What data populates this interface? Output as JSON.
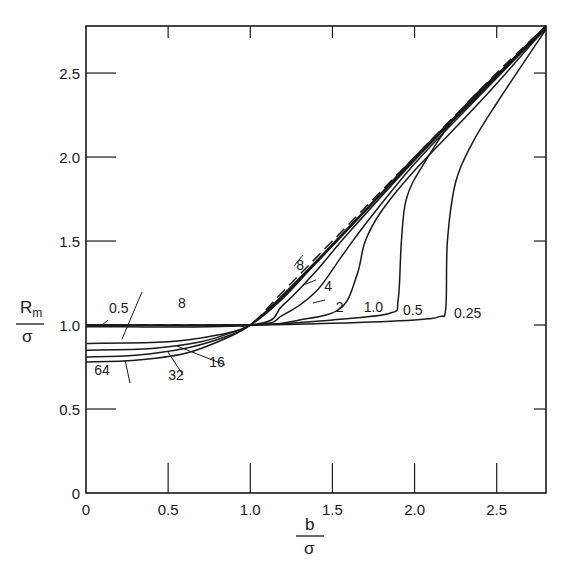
{
  "chart_data": {
    "type": "line",
    "title": "",
    "xlabel": "b / σ",
    "ylabel": "R_m / σ",
    "xlim": [
      0,
      2.8
    ],
    "ylim": [
      0,
      2.78
    ],
    "grid": false,
    "x_ticks": [
      "0",
      "0.5",
      "1.0",
      "1.5",
      "2.0",
      "2.5"
    ],
    "y_ticks": [
      "0",
      "0.5",
      "1.0",
      "1.5",
      "2.0",
      "2.5"
    ],
    "x_tick_values": [
      0,
      0.5,
      1.0,
      1.5,
      2.0,
      2.5
    ],
    "y_tick_values": [
      0,
      0.5,
      1.0,
      1.5,
      2.0,
      2.5
    ],
    "series": [
      {
        "name": "asymptote (dashed)",
        "style": "dashed",
        "x": [
          0,
          0.5,
          0.9,
          1.0,
          1.2,
          1.5,
          2.0,
          2.5,
          2.8
        ],
        "y": [
          1.0,
          1.0,
          1.0,
          1.0,
          1.2,
          1.5,
          2.0,
          2.5,
          2.78
        ]
      },
      {
        "name": "0.25",
        "x": [
          0,
          1.0,
          1.5,
          2.0,
          2.15,
          2.19,
          2.2,
          2.25,
          2.35,
          2.5,
          2.8
        ],
        "y": [
          1.0,
          1.0,
          1.01,
          1.03,
          1.05,
          1.1,
          1.5,
          1.85,
          2.08,
          2.32,
          2.76
        ]
      },
      {
        "name": "0.5",
        "x": [
          0,
          1.0,
          1.5,
          1.85,
          1.9,
          1.92,
          1.95,
          2.05,
          2.3,
          2.8
        ],
        "y": [
          1.0,
          1.0,
          1.03,
          1.07,
          1.15,
          1.5,
          1.75,
          1.95,
          2.3,
          2.76
        ]
      },
      {
        "name": "1.0",
        "x": [
          0,
          1.0,
          1.3,
          1.55,
          1.65,
          1.7,
          1.8,
          2.0,
          2.4,
          2.8
        ],
        "y": [
          1.0,
          1.0,
          1.03,
          1.1,
          1.3,
          1.5,
          1.68,
          1.92,
          2.33,
          2.77
        ]
      },
      {
        "name": "2",
        "x": [
          0,
          1.0,
          1.2,
          1.4,
          1.55,
          1.7,
          2.0,
          2.4,
          2.8
        ],
        "y": [
          1.0,
          1.0,
          1.06,
          1.2,
          1.4,
          1.6,
          1.96,
          2.37,
          2.77
        ]
      },
      {
        "name": "4",
        "x": [
          0,
          1.0,
          1.2,
          1.4,
          1.6,
          2.0,
          2.4,
          2.8
        ],
        "y": [
          0.99,
          1.0,
          1.12,
          1.32,
          1.55,
          1.98,
          2.38,
          2.77
        ]
      },
      {
        "name": "8",
        "x": [
          0,
          0.5,
          0.8,
          1.0,
          1.2,
          1.4,
          1.7,
          2.0,
          2.4,
          2.8
        ],
        "y": [
          0.89,
          0.9,
          0.94,
          1.0,
          1.16,
          1.37,
          1.68,
          2.0,
          2.39,
          2.78
        ]
      },
      {
        "name": "16",
        "x": [
          0,
          0.4,
          0.7,
          0.9,
          1.0,
          1.2,
          1.5,
          2.0,
          2.4,
          2.8
        ],
        "y": [
          0.85,
          0.86,
          0.9,
          0.96,
          1.0,
          1.17,
          1.47,
          1.99,
          2.39,
          2.78
        ]
      },
      {
        "name": "32",
        "x": [
          0,
          0.3,
          0.6,
          0.85,
          1.0,
          1.2,
          1.5,
          2.0,
          2.4,
          2.8
        ],
        "y": [
          0.81,
          0.82,
          0.86,
          0.93,
          1.0,
          1.18,
          1.48,
          1.99,
          2.39,
          2.78
        ]
      },
      {
        "name": "64",
        "x": [
          0,
          0.3,
          0.6,
          0.85,
          1.0,
          1.2,
          1.5,
          2.0,
          2.4,
          2.8
        ],
        "y": [
          0.78,
          0.79,
          0.83,
          0.92,
          1.0,
          1.18,
          1.48,
          1.99,
          2.39,
          2.78
        ]
      }
    ],
    "annotations": [
      {
        "text": "0.5",
        "x": 0.14,
        "y": 1.07
      },
      {
        "text": "8",
        "x": 0.56,
        "y": 1.1
      },
      {
        "text": "64",
        "x": 0.05,
        "y": 0.7
      },
      {
        "text": "32",
        "x": 0.5,
        "y": 0.67
      },
      {
        "text": "16",
        "x": 0.75,
        "y": 0.75
      },
      {
        "text": "8",
        "x": 1.28,
        "y": 1.33
      },
      {
        "text": "4",
        "x": 1.45,
        "y": 1.2
      },
      {
        "text": "2",
        "x": 1.52,
        "y": 1.08
      },
      {
        "text": "1.0",
        "x": 1.69,
        "y": 1.08
      },
      {
        "text": "0.5",
        "x": 1.93,
        "y": 1.06
      },
      {
        "text": "0.25",
        "x": 2.24,
        "y": 1.04
      }
    ],
    "legend": "none (curves labeled inline)"
  },
  "axes": {
    "x_title_top": "b",
    "x_title_bottom": "σ",
    "y_title_top": "R",
    "y_title_sub": "m",
    "y_title_bottom": "σ"
  }
}
